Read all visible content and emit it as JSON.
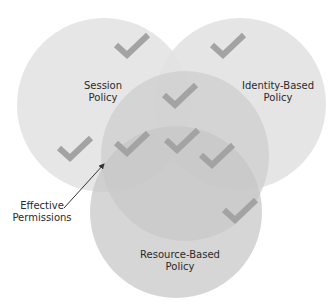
{
  "colors": {
    "background": "#ffffff",
    "session_circle": "#e3e3e3",
    "identity_circle": "#e3e3e3",
    "middle_overlap": "#cfcfcf",
    "resource_ellipse": "#c8c8c8",
    "checkmark": "#a3a3a3",
    "arrow": "#333333",
    "text": "#2a2a2a"
  },
  "regions": [
    {
      "id": "session",
      "label_line1": "Session",
      "label_line2": "Policy"
    },
    {
      "id": "identity",
      "label_line1": "Identity-Based",
      "label_line2": "Policy"
    },
    {
      "id": "resource",
      "label_line1": "Resource-Based",
      "label_line2": "Policy"
    }
  ],
  "callout": {
    "label_line1": "Effective",
    "label_line2": "Permissions"
  },
  "checkmark_count": 8,
  "icons": {
    "checkmark": "checkmark-icon",
    "arrow": "arrow-icon"
  }
}
